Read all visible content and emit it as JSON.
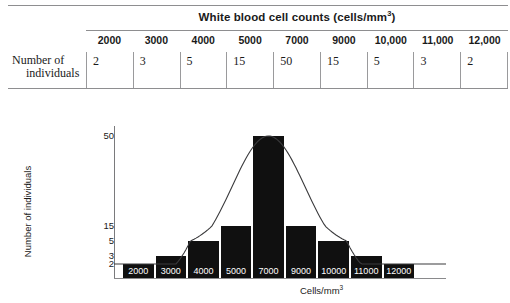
{
  "table": {
    "group_header": "White blood cell counts (cells/mm",
    "group_header_sup": "3",
    "group_header_tail": ")",
    "row_label_line1": "Number of",
    "row_label_line2": "individuals",
    "columns": [
      "2000",
      "3000",
      "4000",
      "5000",
      "7000",
      "9000",
      "10,000",
      "11,000",
      "12,000"
    ],
    "values": [
      "2",
      "3",
      "5",
      "15",
      "50",
      "15",
      "5",
      "3",
      "2"
    ]
  },
  "chart_data": {
    "type": "bar",
    "title": "",
    "categories": [
      "2000",
      "3000",
      "4000",
      "5000",
      "7000",
      "9000",
      "10000",
      "11000",
      "12000"
    ],
    "values": [
      2,
      3,
      5,
      15,
      50,
      15,
      5,
      3,
      2
    ],
    "bar_labels": [
      "2000",
      "3000",
      "4000",
      "5000",
      "7000",
      "9000",
      "10000",
      "11000",
      "12000"
    ],
    "xlabel": "Cells/mm",
    "xlabel_sup": "3",
    "ylabel": "Number of individuals",
    "ytick_labels": [
      "50",
      "15",
      "5",
      "3",
      "2"
    ],
    "ytick_values": [
      50,
      15,
      5,
      3,
      2
    ],
    "ylim": [
      0,
      57
    ],
    "grid": false,
    "legend": false,
    "overlay": {
      "type": "line",
      "name": "normal distribution curve",
      "description": "smooth bell curve overlaid on the histogram"
    },
    "bar_color": "#101010",
    "curve_color": "#3a3a3c"
  }
}
